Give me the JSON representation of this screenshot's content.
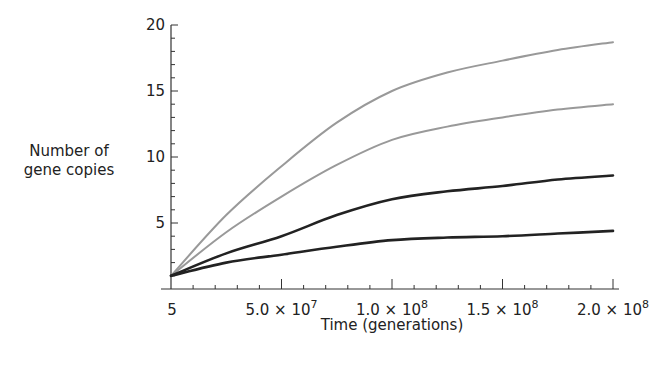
{
  "chart_data": {
    "type": "line",
    "title": "",
    "xlabel": "Time (generations)",
    "ylabel": "Number of gene copies",
    "xlim": [
      5,
      200000000
    ],
    "ylim": [
      0,
      20
    ],
    "grid": false,
    "legend": null,
    "x_ticks": [
      {
        "value": 5,
        "label": "5"
      },
      {
        "value": 50000000,
        "label": "5.0 × 10",
        "exp": "7"
      },
      {
        "value": 100000000,
        "label": "1.0 × 10",
        "exp": "8"
      },
      {
        "value": 150000000,
        "label": "1.5 × 10",
        "exp": "8"
      },
      {
        "value": 200000000,
        "label": "2.0 × 10",
        "exp": "8"
      }
    ],
    "y_ticks": [
      5,
      10,
      15,
      20
    ],
    "x": [
      5,
      25000000,
      50000000,
      75000000,
      100000000,
      125000000,
      150000000,
      175000000,
      200000000
    ],
    "series": [
      {
        "name": "curve-1 (gray, highest)",
        "color": "#999999",
        "width": 2,
        "values": [
          1.0,
          5.6,
          9.3,
          12.6,
          15.0,
          16.4,
          17.3,
          18.1,
          18.7
        ]
      },
      {
        "name": "curve-2 (gray)",
        "color": "#999999",
        "width": 2,
        "values": [
          1.0,
          4.3,
          7.0,
          9.4,
          11.3,
          12.3,
          13.0,
          13.6,
          14.0
        ]
      },
      {
        "name": "curve-3 (black)",
        "color": "#222222",
        "width": 2.6,
        "values": [
          1.0,
          2.7,
          4.0,
          5.6,
          6.8,
          7.4,
          7.8,
          8.3,
          8.6
        ]
      },
      {
        "name": "curve-4 (black, lowest)",
        "color": "#222222",
        "width": 2.6,
        "values": [
          1.0,
          2.0,
          2.6,
          3.2,
          3.7,
          3.9,
          4.0,
          4.2,
          4.4
        ]
      }
    ]
  },
  "labels": {
    "ylabel_line1": "Number of",
    "ylabel_line2": "gene copies",
    "xlabel": "Time (generations)"
  }
}
